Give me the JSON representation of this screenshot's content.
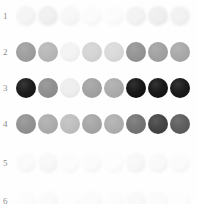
{
  "figure": {
    "background_color": "#fefefe",
    "row_count": 6,
    "columns_per_row": 8,
    "spot_diameter_px": 20,
    "spot_pitch_px": 22,
    "first_spot_left_px": 16
  },
  "rows": [
    {
      "label": "1",
      "top": 5,
      "faint": true,
      "spots": [
        {
          "color": "#f4f4f4"
        },
        {
          "color": "#efefef"
        },
        {
          "color": "#f7f7f7"
        },
        {
          "color": "#fbfbfb"
        },
        {
          "color": "#fcfcfc"
        },
        {
          "color": "#f2f2f2"
        },
        {
          "color": "#eeeeee"
        },
        {
          "color": "#f1f1f1"
        }
      ]
    },
    {
      "label": "2",
      "top": 41,
      "faint": false,
      "spots": [
        {
          "color": "#9a9a9a"
        },
        {
          "color": "#b4b4b4"
        },
        {
          "color": "#f3f3f3"
        },
        {
          "color": "#d2d2d2"
        },
        {
          "color": "#d8d8d8"
        },
        {
          "color": "#8f8f8f"
        },
        {
          "color": "#9d9d9d"
        },
        {
          "color": "#a5a5a5"
        }
      ]
    },
    {
      "label": "3",
      "top": 77,
      "faint": false,
      "spots": [
        {
          "color": "#111111"
        },
        {
          "color": "#8a8a8a"
        },
        {
          "color": "#ededed"
        },
        {
          "color": "#9e9e9e"
        },
        {
          "color": "#a8a8a8"
        },
        {
          "color": "#0b0b0b"
        },
        {
          "color": "#0d0d0d"
        },
        {
          "color": "#0f0f0f"
        }
      ]
    },
    {
      "label": "4",
      "top": 113,
      "faint": false,
      "spots": [
        {
          "color": "#8d8d8d"
        },
        {
          "color": "#a9a9a9"
        },
        {
          "color": "#bcbcbc"
        },
        {
          "color": "#a2a2a2"
        },
        {
          "color": "#ababab"
        },
        {
          "color": "#6e6e6e"
        },
        {
          "color": "#3c3c3c"
        },
        {
          "color": "#565656"
        }
      ]
    },
    {
      "label": "5",
      "top": 152,
      "faint": true,
      "spots": [
        {
          "color": "#fafafa"
        },
        {
          "color": "#f8f8f8"
        },
        {
          "color": "#fcfcfc"
        },
        {
          "color": "#fbfbfb"
        },
        {
          "color": "#fdfdfd"
        },
        {
          "color": "#f7f7f7"
        },
        {
          "color": "#f9f9f9"
        },
        {
          "color": "#fbfbfb"
        }
      ]
    },
    {
      "label": "6",
      "top": 190,
      "faint": true,
      "spots": [
        {
          "color": "#fcfcfc"
        },
        {
          "color": "#fafafa"
        },
        {
          "color": "#fdfdfd"
        },
        {
          "color": "#fbfbfb"
        },
        {
          "color": "#fcfcfc"
        },
        {
          "color": "#f9f9f9"
        },
        {
          "color": "#fbfbfb"
        },
        {
          "color": "#fdfdfd"
        }
      ]
    }
  ]
}
